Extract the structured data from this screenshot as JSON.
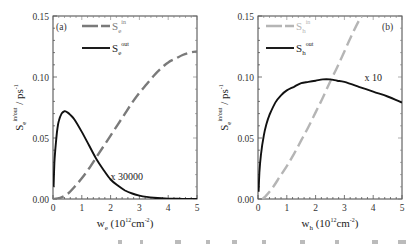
{
  "chart_data": [
    {
      "type": "line",
      "panel_label": "(a)",
      "xlabel": {
        "main": "w",
        "sub": "e",
        "unit_prefix": "(10",
        "unit_exp": "12",
        "unit_mid": "cm",
        "unit_exp2": "-2",
        "unit_suffix": ")"
      },
      "ylabel": {
        "main": "S",
        "sub": "e",
        "sup": "in/out",
        "rest": " / ps",
        "rest_sup": "-1"
      },
      "xlim": [
        0,
        5
      ],
      "ylim": [
        0,
        0.15
      ],
      "xticks": [
        "0",
        "1",
        "2",
        "3",
        "4",
        "5"
      ],
      "yticks": [
        "0.00",
        "0.05",
        "0.10",
        "0.15"
      ],
      "grid": false,
      "legend_position": "top-left",
      "annotation": {
        "text": "x 30000",
        "x": 2.0,
        "y": 0.019
      },
      "series": [
        {
          "name": "S_e^in",
          "legend": {
            "main": "S",
            "sub": "e",
            "sup": "in"
          },
          "style": "dashed",
          "color": "#7a7a7a",
          "x": [
            0,
            0.25,
            0.5,
            0.75,
            1.0,
            1.25,
            1.5,
            1.75,
            2.0,
            2.25,
            2.5,
            2.75,
            3.0,
            3.25,
            3.5,
            3.75,
            4.0,
            4.25,
            4.5,
            4.75,
            5.0
          ],
          "y": [
            0.0,
            0.001,
            0.004,
            0.01,
            0.017,
            0.025,
            0.034,
            0.043,
            0.052,
            0.061,
            0.07,
            0.079,
            0.087,
            0.094,
            0.101,
            0.107,
            0.112,
            0.115,
            0.118,
            0.12,
            0.121
          ]
        },
        {
          "name": "S_e^out",
          "legend": {
            "main": "S",
            "sub": "e",
            "sup": "out"
          },
          "style": "solid",
          "color": "#111111",
          "x": [
            0.02,
            0.05,
            0.1,
            0.15,
            0.2,
            0.3,
            0.4,
            0.5,
            0.6,
            0.75,
            1.0,
            1.25,
            1.5,
            1.75,
            2.0,
            2.25,
            2.5,
            2.75,
            3.0,
            3.25,
            3.5,
            4.0,
            4.5,
            5.0
          ],
          "y": [
            0.01,
            0.03,
            0.046,
            0.057,
            0.064,
            0.07,
            0.072,
            0.071,
            0.069,
            0.065,
            0.055,
            0.044,
            0.033,
            0.024,
            0.016,
            0.011,
            0.007,
            0.0045,
            0.0028,
            0.0017,
            0.001,
            0.0003,
            0.0001,
            0.0
          ]
        }
      ]
    },
    {
      "type": "line",
      "panel_label": "(b)",
      "xlabel": {
        "main": "w",
        "sub": "h",
        "unit_prefix": "(10",
        "unit_exp": "12",
        "unit_mid": "cm",
        "unit_exp2": "-2",
        "unit_suffix": ")"
      },
      "ylabel": {
        "main": "S",
        "sub": "e",
        "sup": "in/out",
        "rest": " / ps",
        "rest_sup": "-1"
      },
      "xlim": [
        0,
        5
      ],
      "ylim": [
        0,
        0.15
      ],
      "xticks": [
        "0",
        "1",
        "2",
        "3",
        "4",
        "5"
      ],
      "yticks": [
        "0.00",
        "0.05",
        "0.10",
        "0.15"
      ],
      "grid": false,
      "legend_position": "top-left",
      "annotation": {
        "text": "x 10",
        "x": 3.7,
        "y": 0.1
      },
      "series": [
        {
          "name": "S_h^in",
          "legend": {
            "main": "S",
            "sub": "h",
            "sup": "in"
          },
          "style": "dashed",
          "color": "#b5b5b5",
          "x": [
            0.15,
            0.25,
            0.5,
            0.75,
            1.0,
            1.25,
            1.5,
            1.75,
            2.0,
            2.25,
            2.5,
            2.75,
            3.0,
            3.25,
            3.5,
            3.6
          ],
          "y": [
            0.0,
            0.002,
            0.009,
            0.018,
            0.027,
            0.037,
            0.048,
            0.059,
            0.071,
            0.083,
            0.096,
            0.108,
            0.121,
            0.134,
            0.146,
            0.15
          ]
        },
        {
          "name": "S_h^out",
          "legend": {
            "main": "S",
            "sub": "h",
            "sup": "out"
          },
          "style": "solid",
          "color": "#111111",
          "x": [
            0.02,
            0.05,
            0.1,
            0.2,
            0.3,
            0.4,
            0.6,
            0.8,
            1.0,
            1.25,
            1.5,
            1.75,
            2.0,
            2.25,
            2.5,
            2.75,
            3.0,
            3.5,
            4.0,
            4.5,
            5.0
          ],
          "y": [
            0.006,
            0.022,
            0.036,
            0.052,
            0.062,
            0.069,
            0.079,
            0.085,
            0.089,
            0.092,
            0.095,
            0.096,
            0.097,
            0.098,
            0.098,
            0.097,
            0.096,
            0.092,
            0.088,
            0.084,
            0.079
          ]
        }
      ]
    }
  ]
}
